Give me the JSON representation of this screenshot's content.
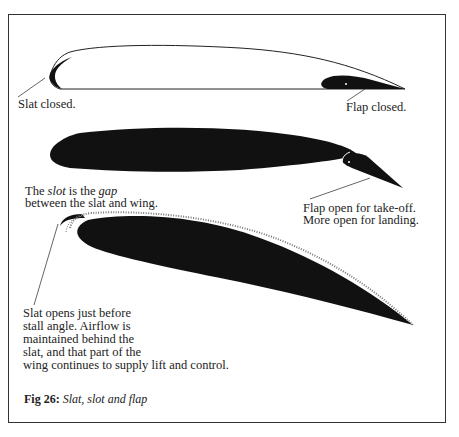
{
  "figure": {
    "number_label": "Fig 26:",
    "title": "Slat, slot and flap"
  },
  "panels": [
    {
      "id": "closed",
      "labels": {
        "slat": "Slat closed.",
        "flap": "Flap closed."
      }
    },
    {
      "id": "flap-open",
      "labels": {
        "slot_prefix": "The ",
        "slot_word": "slot",
        "slot_mid": " is the ",
        "gap_word": "gap",
        "slot_line2": "between the slat and wing.",
        "flap_line1": "Flap open for take-off.",
        "flap_line2": "More open for landing."
      }
    },
    {
      "id": "slat-open",
      "labels": {
        "line1": "Slat opens just before",
        "line2": "stall angle. Airflow is",
        "line3": "maintained behind the",
        "line4": "slat, and that part of the",
        "line5": "wing continues to supply lift and control."
      }
    }
  ],
  "colors": {
    "ink": "#111111",
    "frame": "#333333",
    "background": "#ffffff"
  }
}
